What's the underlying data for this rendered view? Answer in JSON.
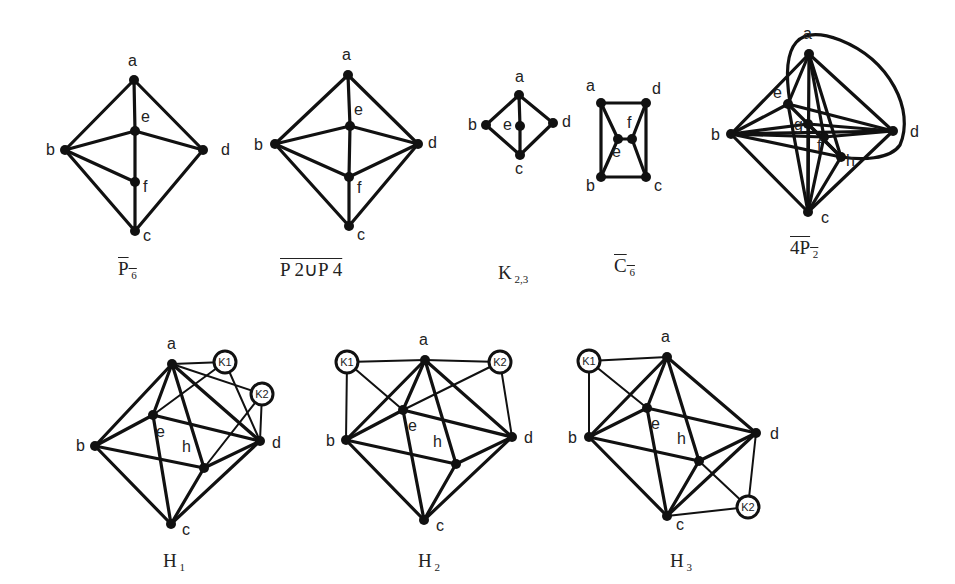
{
  "figure": {
    "graphs": [
      {
        "id": "p6-complement",
        "caption": {
          "main": "P",
          "sub": "6",
          "overline": true
        },
        "caption_pos": [
          118,
          258
        ],
        "nodes": {
          "a": [
            134,
            80
          ],
          "b": [
            65,
            150
          ],
          "d": [
            203,
            150
          ],
          "e": [
            135,
            131
          ],
          "f": [
            135,
            182
          ],
          "c": [
            135,
            231
          ]
        },
        "labels": {
          "a": [
            128,
            66
          ],
          "b": [
            46,
            155
          ],
          "d": [
            221,
            155
          ],
          "e": [
            141,
            122
          ],
          "f": [
            143,
            192
          ],
          "c": [
            143,
            241
          ]
        },
        "edges": [
          [
            "a",
            "b"
          ],
          [
            "a",
            "d"
          ],
          [
            "a",
            "e"
          ],
          [
            "b",
            "e"
          ],
          [
            "e",
            "d"
          ],
          [
            "e",
            "f"
          ],
          [
            "b",
            "f"
          ],
          [
            "f",
            "c"
          ],
          [
            "b",
            "c"
          ],
          [
            "d",
            "c"
          ]
        ]
      },
      {
        "id": "p2-union-p4-complement",
        "caption": {
          "main": "P 2∪P 4",
          "sub": "",
          "overline": true
        },
        "caption_pos": [
          280,
          258
        ],
        "nodes": {
          "a": [
            348,
            75
          ],
          "b": [
            275,
            144
          ],
          "d": [
            418,
            144
          ],
          "e": [
            350,
            126
          ],
          "f": [
            349,
            177
          ],
          "c": [
            349,
            226
          ]
        },
        "labels": {
          "a": [
            342,
            60
          ],
          "b": [
            254,
            150
          ],
          "d": [
            428,
            148
          ],
          "e": [
            354,
            115
          ],
          "f": [
            357,
            193
          ],
          "c": [
            357,
            240
          ]
        },
        "edges": [
          [
            "a",
            "b"
          ],
          [
            "a",
            "d"
          ],
          [
            "a",
            "e"
          ],
          [
            "b",
            "e"
          ],
          [
            "e",
            "d"
          ],
          [
            "e",
            "f"
          ],
          [
            "b",
            "f"
          ],
          [
            "f",
            "d"
          ],
          [
            "f",
            "c"
          ],
          [
            "b",
            "c"
          ],
          [
            "d",
            "c"
          ]
        ]
      },
      {
        "id": "k23",
        "caption": {
          "main": "K",
          "sub": "2,3",
          "overline": false
        },
        "caption_pos": [
          498,
          262
        ],
        "nodes": {
          "a": [
            519,
            95
          ],
          "b": [
            486,
            125
          ],
          "e": [
            520,
            126
          ],
          "d": [
            553,
            123
          ],
          "c": [
            520,
            155
          ]
        },
        "labels": {
          "a": [
            515,
            82
          ],
          "b": [
            468,
            130
          ],
          "e": [
            503,
            130
          ],
          "d": [
            562,
            127
          ],
          "c": [
            515,
            174
          ]
        },
        "edges": [
          [
            "a",
            "b"
          ],
          [
            "a",
            "d"
          ],
          [
            "a",
            "e"
          ],
          [
            "e",
            "c"
          ],
          [
            "b",
            "c"
          ],
          [
            "d",
            "c"
          ]
        ]
      },
      {
        "id": "c6-complement",
        "caption": {
          "main": "C",
          "sub": "6",
          "overline": true
        },
        "caption_pos": [
          614,
          255
        ],
        "nodes": {
          "a": [
            601,
            103
          ],
          "d": [
            646,
            103
          ],
          "e": [
            618,
            139
          ],
          "f": [
            632,
            139
          ],
          "b": [
            601,
            177
          ],
          "c": [
            646,
            177
          ]
        },
        "labels": {
          "a": [
            586,
            91
          ],
          "d": [
            652,
            94
          ],
          "e": [
            612,
            157
          ],
          "f": [
            627,
            128
          ],
          "b": [
            586,
            191
          ],
          "c": [
            654,
            191
          ]
        },
        "edges": [
          [
            "a",
            "d"
          ],
          [
            "a",
            "b"
          ],
          [
            "d",
            "c"
          ],
          [
            "b",
            "c"
          ],
          [
            "a",
            "e"
          ],
          [
            "e",
            "f"
          ],
          [
            "f",
            "d"
          ],
          [
            "e",
            "b"
          ],
          [
            "f",
            "c"
          ]
        ]
      },
      {
        "id": "4p2-complement",
        "caption": {
          "main": "4P",
          "sub": "2",
          "overline": true
        },
        "caption_pos": [
          790,
          237
        ],
        "nodes": {
          "a": [
            809,
            54
          ],
          "b": [
            731,
            134
          ],
          "e": [
            788,
            104
          ],
          "g": [
            808,
            124
          ],
          "f": [
            824,
            137
          ],
          "h": [
            841,
            157
          ],
          "d": [
            893,
            131
          ],
          "c": [
            808,
            212
          ]
        },
        "labels": {
          "a": [
            803,
            39
          ],
          "b": [
            711,
            140
          ],
          "e": [
            773,
            98
          ],
          "g": [
            794,
            130
          ],
          "f": [
            817,
            151
          ],
          "h": [
            846,
            166
          ],
          "d": [
            910,
            137
          ],
          "c": [
            821,
            223
          ]
        },
        "edges": [
          [
            "a",
            "b"
          ],
          [
            "a",
            "d"
          ],
          [
            "a",
            "e"
          ],
          [
            "a",
            "f"
          ],
          [
            "a",
            "h"
          ],
          [
            "a",
            "c"
          ],
          [
            "b",
            "e"
          ],
          [
            "b",
            "g"
          ],
          [
            "b",
            "f"
          ],
          [
            "b",
            "h"
          ],
          [
            "b",
            "d"
          ],
          [
            "b",
            "c"
          ],
          [
            "e",
            "d"
          ],
          [
            "e",
            "h"
          ],
          [
            "e",
            "c"
          ],
          [
            "g",
            "d"
          ],
          [
            "g",
            "h"
          ],
          [
            "g",
            "c"
          ],
          [
            "f",
            "d"
          ],
          [
            "f",
            "c"
          ],
          [
            "h",
            "c"
          ],
          [
            "d",
            "c"
          ]
        ],
        "loops": [
          {
            "path": "M 790 103 C 780 40, 800 25, 840 40 C 890 60, 915 110, 900 145 C 890 160, 860 160, 842 157"
          }
        ]
      },
      {
        "id": "h1",
        "caption": {
          "main": "H",
          "sub": "1",
          "overline": false
        },
        "caption_pos": [
          163,
          550
        ],
        "nodes": {
          "a": [
            172,
            364
          ],
          "b": [
            95,
            446
          ],
          "e": [
            153,
            415
          ],
          "h": [
            204,
            468
          ],
          "d": [
            260,
            441
          ],
          "c": [
            171,
            524
          ]
        },
        "knodes": {
          "K1": [
            225,
            362
          ],
          "K2": [
            262,
            394
          ]
        },
        "labels": {
          "a": [
            167,
            349
          ],
          "b": [
            76,
            451
          ],
          "e": [
            156,
            437
          ],
          "h": [
            182,
            452
          ],
          "d": [
            272,
            448
          ],
          "c": [
            182,
            535
          ]
        },
        "edges": [
          [
            "a",
            "b"
          ],
          [
            "a",
            "e"
          ],
          [
            "a",
            "h"
          ],
          [
            "a",
            "d"
          ],
          [
            "b",
            "e"
          ],
          [
            "e",
            "d"
          ],
          [
            "b",
            "h"
          ],
          [
            "e",
            "c"
          ],
          [
            "b",
            "c"
          ],
          [
            "h",
            "d"
          ],
          [
            "h",
            "c"
          ],
          [
            "d",
            "c"
          ],
          [
            "a",
            "K1"
          ],
          [
            "a",
            "K2"
          ],
          [
            "e",
            "K1"
          ],
          [
            "K1",
            "d"
          ],
          [
            "K2",
            "d"
          ],
          [
            "K2",
            "h"
          ]
        ]
      },
      {
        "id": "h2",
        "caption": {
          "main": "H",
          "sub": "2",
          "overline": false
        },
        "caption_pos": [
          418,
          550
        ],
        "nodes": {
          "a": [
            425,
            360
          ],
          "b": [
            346,
            440
          ],
          "e": [
            403,
            410
          ],
          "h": [
            456,
            464
          ],
          "d": [
            512,
            437
          ],
          "c": [
            424,
            520
          ]
        },
        "knodes": {
          "K1": [
            347,
            362
          ],
          "K2": [
            500,
            362
          ]
        },
        "labels": {
          "a": [
            419,
            345
          ],
          "b": [
            326,
            446
          ],
          "e": [
            408,
            431
          ],
          "h": [
            433,
            447
          ],
          "d": [
            524,
            443
          ],
          "c": [
            436,
            531
          ]
        },
        "edges": [
          [
            "a",
            "b"
          ],
          [
            "a",
            "e"
          ],
          [
            "a",
            "h"
          ],
          [
            "a",
            "d"
          ],
          [
            "b",
            "e"
          ],
          [
            "e",
            "d"
          ],
          [
            "b",
            "h"
          ],
          [
            "e",
            "c"
          ],
          [
            "b",
            "c"
          ],
          [
            "h",
            "d"
          ],
          [
            "h",
            "c"
          ],
          [
            "d",
            "c"
          ],
          [
            "K1",
            "a"
          ],
          [
            "K2",
            "a"
          ],
          [
            "K1",
            "b"
          ],
          [
            "K2",
            "d"
          ],
          [
            "K1",
            "e"
          ],
          [
            "K2",
            "e"
          ]
        ]
      },
      {
        "id": "h3",
        "caption": {
          "main": "H",
          "sub": "3",
          "overline": false
        },
        "caption_pos": [
          670,
          550
        ],
        "nodes": {
          "a": [
            667,
            357
          ],
          "b": [
            589,
            437
          ],
          "e": [
            647,
            408
          ],
          "h": [
            699,
            461
          ],
          "d": [
            756,
            433
          ],
          "c": [
            667,
            516
          ]
        },
        "knodes": {
          "K1": [
            589,
            361
          ],
          "K2": [
            748,
            507
          ]
        },
        "labels": {
          "a": [
            661,
            342
          ],
          "b": [
            568,
            443
          ],
          "e": [
            651,
            429
          ],
          "h": [
            677,
            444
          ],
          "d": [
            770,
            439
          ],
          "c": [
            676,
            530
          ]
        },
        "edges": [
          [
            "a",
            "b"
          ],
          [
            "a",
            "e"
          ],
          [
            "a",
            "h"
          ],
          [
            "a",
            "d"
          ],
          [
            "b",
            "e"
          ],
          [
            "e",
            "d"
          ],
          [
            "b",
            "h"
          ],
          [
            "e",
            "c"
          ],
          [
            "b",
            "c"
          ],
          [
            "h",
            "d"
          ],
          [
            "h",
            "c"
          ],
          [
            "d",
            "c"
          ],
          [
            "K1",
            "a"
          ],
          [
            "K1",
            "b"
          ],
          [
            "K1",
            "e"
          ],
          [
            "K2",
            "d"
          ],
          [
            "K2",
            "c"
          ],
          [
            "K2",
            "h"
          ]
        ]
      }
    ]
  }
}
